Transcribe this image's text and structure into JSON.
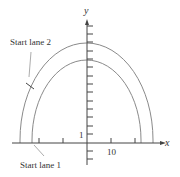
{
  "diagram": {
    "type": "elliptical-race-track",
    "colors": {
      "axis": "#444444",
      "track": "#8a8a8a",
      "text": "#333333",
      "pointer": "#888888"
    },
    "axes": {
      "x_label": "x",
      "y_label": "y",
      "x_tick_label": "10",
      "y_tick_label": "1"
    },
    "annotations": {
      "lane2": "Start lane 2",
      "lane1": "Start lane 1"
    },
    "tracks": [
      {
        "name": "outer-lane",
        "x_semi_axis": 28,
        "y_semi_axis": 12.5
      },
      {
        "name": "inner-lane",
        "x_semi_axis": 23,
        "y_semi_axis": 10.5
      }
    ]
  }
}
